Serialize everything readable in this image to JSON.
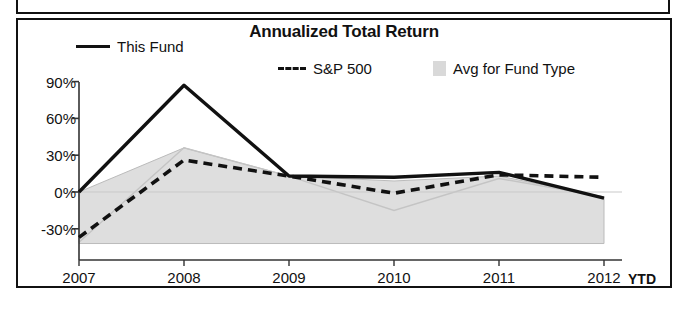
{
  "chart_data": {
    "type": "line",
    "title": "Annualized Total Return",
    "xlabel": "",
    "ylabel": "",
    "ylim": [
      -45,
      95
    ],
    "ytick_values": [
      90,
      60,
      30,
      0,
      -30
    ],
    "ytick_labels": [
      "90%",
      "60%",
      "30%",
      "0%",
      "-30%"
    ],
    "categories": [
      "2007",
      "2008",
      "2009",
      "2010",
      "2011",
      "2012"
    ],
    "x_suffix_label": "YTD",
    "grid": false,
    "legend_position": "top",
    "series": [
      {
        "name": "This Fund",
        "style": "solid",
        "color": "#111111",
        "values": [
          0,
          87,
          13,
          12,
          16,
          -5
        ]
      },
      {
        "name": "S&P 500",
        "style": "dashed",
        "color": "#111111",
        "values": [
          -37,
          26,
          13,
          -1,
          14,
          12
        ]
      },
      {
        "name": "Avg for Fund Type",
        "style": "band",
        "color": "#d9d9d9",
        "band_upper": [
          0,
          36,
          13,
          9,
          13,
          -4
        ],
        "band_lower": [
          -42,
          -42,
          -42,
          -42,
          -42,
          -42
        ]
      }
    ],
    "band_note_values": {
      "avg_line": [
        -41,
        36,
        13,
        -15,
        11,
        -4
      ]
    }
  },
  "legend": {
    "items": [
      {
        "label": "This Fund",
        "key": "solid-line-key"
      },
      {
        "label": "S&P 500",
        "key": "dashed-line-key"
      },
      {
        "label": "Avg for Fund Type",
        "key": "shaded-swatch-key"
      }
    ]
  }
}
